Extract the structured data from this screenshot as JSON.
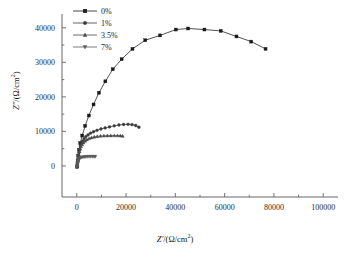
{
  "chart_data": {
    "type": "scatter",
    "title": "",
    "subtitle": "",
    "xlabel": "Z'/(Ω/cm2)",
    "ylabel": "Z''/(Ω/cm2)",
    "xlabel_parts": {
      "sym": "Z'",
      "unit_open": "/(Ω/cm",
      "sup": "2",
      "unit_close": ")"
    },
    "ylabel_parts": {
      "sym": "Z''",
      "unit_open": "/(Ω/cm",
      "sup": "2",
      "unit_close": ")"
    },
    "xlim": [
      -6000,
      106000
    ],
    "ylim": [
      -9000,
      44000
    ],
    "xticks": [
      0,
      20000,
      40000,
      60000,
      80000,
      100000
    ],
    "xticklabels": [
      "0",
      "20000",
      "40000",
      "60000",
      "80000",
      "100000"
    ],
    "yticks": [
      0,
      10000,
      20000,
      30000,
      40000
    ],
    "yticklabels": [
      "0",
      "10000",
      "20000",
      "30000",
      "40000"
    ],
    "xminor_step": 10000,
    "yminor_step": 5000,
    "grid": false,
    "legend_position": "upper left",
    "legend_frame": false,
    "series": [
      {
        "name": "0%",
        "marker": "square",
        "color": "#1a1a1a",
        "points": [
          [
            200,
            -250
          ],
          [
            350,
            1400
          ],
          [
            600,
            3000
          ],
          [
            900,
            4700
          ],
          [
            1400,
            6600
          ],
          [
            2200,
            8800
          ],
          [
            3400,
            11600
          ],
          [
            4900,
            14600
          ],
          [
            6800,
            17800
          ],
          [
            9000,
            21200
          ],
          [
            11600,
            24500
          ],
          [
            14600,
            28000
          ],
          [
            18200,
            30900
          ],
          [
            22600,
            33900
          ],
          [
            27800,
            36400
          ],
          [
            33800,
            37800
          ],
          [
            40200,
            39500
          ],
          [
            45200,
            39800
          ],
          [
            51800,
            39500
          ],
          [
            58400,
            39100
          ],
          [
            64800,
            37500
          ],
          [
            70800,
            36000
          ],
          [
            76600,
            33900
          ]
        ]
      },
      {
        "name": "1%",
        "marker": "circle",
        "color": "#3a3a3a",
        "points": [
          [
            150,
            -150
          ],
          [
            220,
            500
          ],
          [
            330,
            1200
          ],
          [
            470,
            2000
          ],
          [
            650,
            2900
          ],
          [
            880,
            3900
          ],
          [
            1160,
            4800
          ],
          [
            1500,
            5700
          ],
          [
            1900,
            6500
          ],
          [
            2400,
            7200
          ],
          [
            3000,
            7900
          ],
          [
            3700,
            8500
          ],
          [
            4600,
            9000
          ],
          [
            5600,
            9500
          ],
          [
            6800,
            9900
          ],
          [
            8200,
            10300
          ],
          [
            9800,
            10700
          ],
          [
            11500,
            11000
          ],
          [
            13300,
            11300
          ],
          [
            15200,
            11600
          ],
          [
            17100,
            11850
          ],
          [
            19000,
            12000
          ],
          [
            20800,
            12050
          ],
          [
            22400,
            11950
          ],
          [
            23900,
            11700
          ],
          [
            25200,
            11200
          ]
        ]
      },
      {
        "name": "3.5%",
        "marker": "triangle-up",
        "color": "#4a4a4a",
        "points": [
          [
            130,
            -150
          ],
          [
            200,
            450
          ],
          [
            300,
            1100
          ],
          [
            430,
            1800
          ],
          [
            600,
            2600
          ],
          [
            800,
            3400
          ],
          [
            1050,
            4200
          ],
          [
            1350,
            4950
          ],
          [
            1700,
            5600
          ],
          [
            2150,
            6200
          ],
          [
            2700,
            6750
          ],
          [
            3350,
            7200
          ],
          [
            4100,
            7600
          ],
          [
            5000,
            7950
          ],
          [
            6000,
            8200
          ],
          [
            7100,
            8400
          ],
          [
            8300,
            8550
          ],
          [
            9600,
            8650
          ],
          [
            11000,
            8720
          ],
          [
            12400,
            8760
          ],
          [
            13800,
            8780
          ],
          [
            15200,
            8790
          ],
          [
            16500,
            8790
          ],
          [
            17700,
            8750
          ],
          [
            18600,
            8650
          ]
        ]
      },
      {
        "name": "7%",
        "marker": "triangle-down",
        "color": "#5a5a5a",
        "points": [
          [
            120,
            -200
          ],
          [
            170,
            200
          ],
          [
            240,
            620
          ],
          [
            330,
            1000
          ],
          [
            440,
            1350
          ],
          [
            580,
            1650
          ],
          [
            760,
            1900
          ],
          [
            980,
            2100
          ],
          [
            1250,
            2250
          ],
          [
            1600,
            2400
          ],
          [
            2000,
            2500
          ],
          [
            2500,
            2570
          ],
          [
            3050,
            2620
          ],
          [
            3650,
            2660
          ],
          [
            4300,
            2690
          ],
          [
            5000,
            2700
          ],
          [
            5700,
            2710
          ],
          [
            6400,
            2710
          ],
          [
            7000,
            2700
          ],
          [
            7500,
            2690
          ]
        ]
      }
    ]
  }
}
